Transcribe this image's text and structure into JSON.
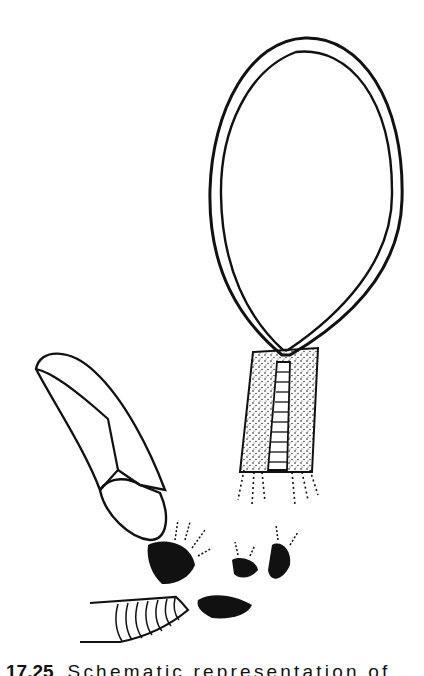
{
  "figure": {
    "number": "17.25",
    "caption_visible": "Schematic representation of",
    "colors": {
      "ink": "#111111",
      "paper": "#ffffff"
    },
    "parts": [
      {
        "id": "capsule",
        "label": ""
      },
      {
        "id": "seta",
        "label": ""
      },
      {
        "id": "leaf-sheath",
        "label": ""
      },
      {
        "id": "rhizoid-tufts",
        "label": ""
      },
      {
        "id": "ribbed-stalk",
        "label": ""
      }
    ]
  }
}
